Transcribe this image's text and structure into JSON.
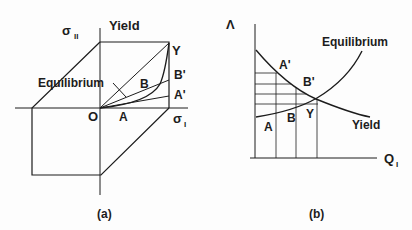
{
  "figure": {
    "ink_color": "#1c1c1c",
    "background": "#fdfdfd",
    "panel_a": {
      "caption": "(a)",
      "axis_y_label": "σ",
      "axis_y_sub": "II",
      "axis_x_label": "σ",
      "axis_x_sub": "I",
      "yield_label": "Yield",
      "equilibrium_label": "Equilibrium",
      "points": {
        "origin": "O",
        "A": "A",
        "B": "B",
        "Y": "Y",
        "A_prime": "A'",
        "B_prime": "B'"
      }
    },
    "panel_b": {
      "caption": "(b)",
      "axis_y_label": "Λ",
      "axis_x_label": "Q",
      "axis_x_sub": "I",
      "equilibrium_label": "Equilibrium",
      "yield_label": "Yield",
      "points": {
        "A": "A",
        "B": "B",
        "Y": "Y",
        "A_prime": "A'",
        "B_prime": "B'"
      }
    }
  }
}
